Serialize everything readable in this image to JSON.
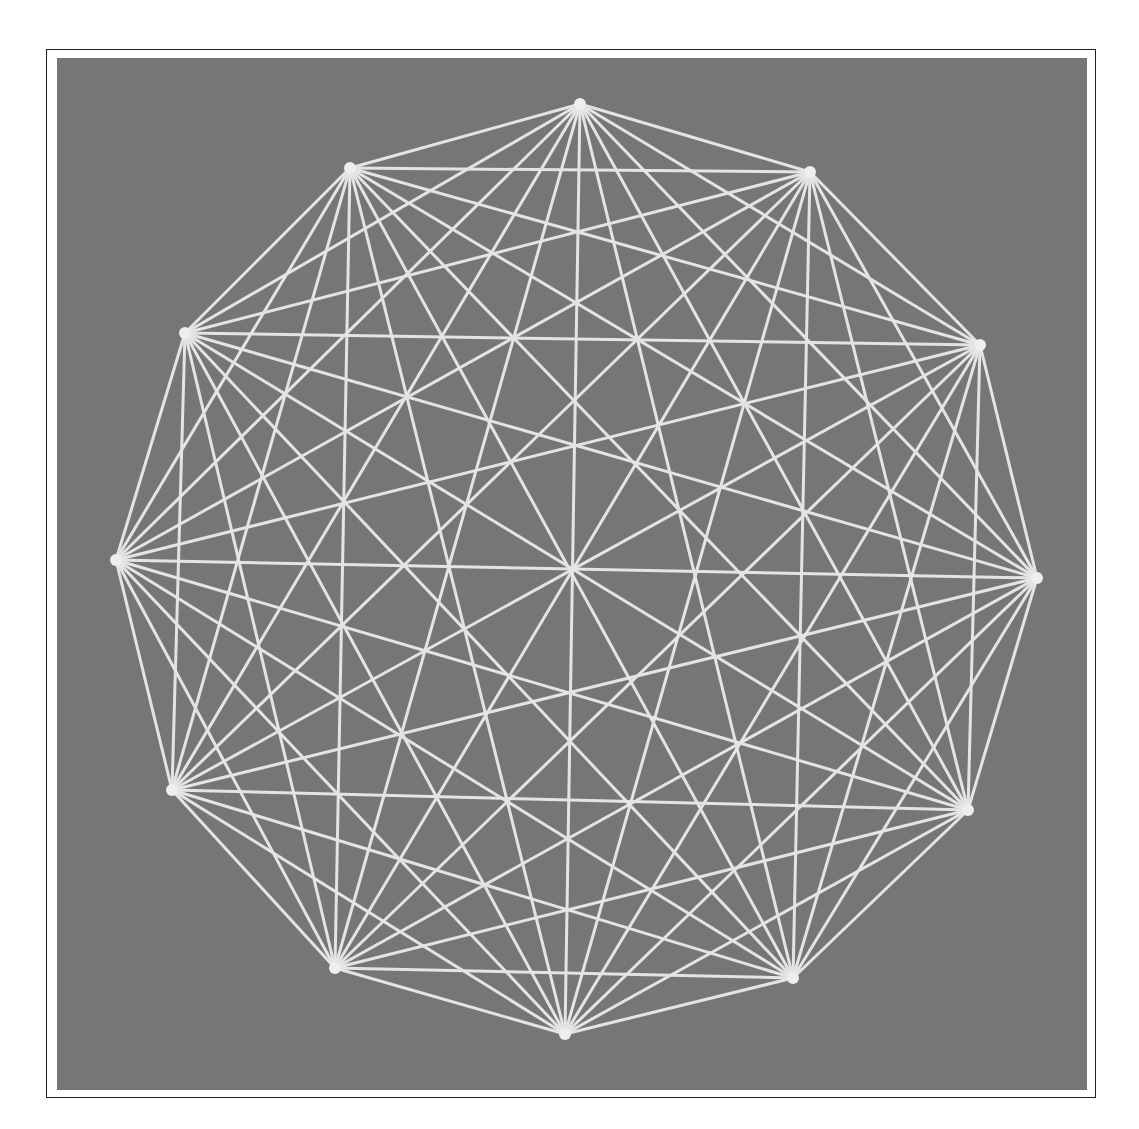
{
  "figure": {
    "colors": {
      "background": "#767676",
      "line": "#e4e4e4",
      "frame": "#222222",
      "page": "#ffffff"
    },
    "vertices": [
      [
        580,
        104
      ],
      [
        810,
        172
      ],
      [
        980,
        345
      ],
      [
        1037,
        578
      ],
      [
        968,
        810
      ],
      [
        793,
        978
      ],
      [
        565,
        1034
      ],
      [
        335,
        968
      ],
      [
        172,
        790
      ],
      [
        116,
        560
      ],
      [
        185,
        333
      ],
      [
        350,
        168
      ]
    ]
  }
}
